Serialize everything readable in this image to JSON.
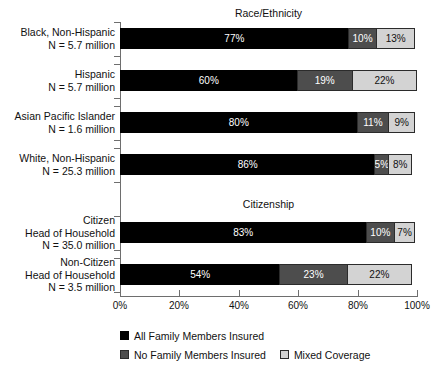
{
  "chart_data": {
    "type": "bar",
    "orientation": "horizontal",
    "stacked": true,
    "title": "",
    "xlabel": "",
    "ylabel": "",
    "xlim": [
      0,
      100
    ],
    "xticks": [
      "0%",
      "20%",
      "40%",
      "60%",
      "80%",
      "100%"
    ],
    "xtick_values": [
      0,
      20,
      40,
      60,
      80,
      100
    ],
    "grid": false,
    "legend_position": "bottom-left",
    "series": [
      {
        "name": "All Family Members Insured",
        "color": "#000000",
        "values": [
          77,
          60,
          80,
          86,
          83,
          54
        ]
      },
      {
        "name": "No Family Members Insured",
        "color": "#4d4d4d",
        "values": [
          10,
          19,
          11,
          5,
          10,
          23
        ]
      },
      {
        "name": "Mixed Coverage",
        "color": "#d3d3d3",
        "values": [
          13,
          22,
          9,
          8,
          7,
          22
        ]
      }
    ],
    "categories": [
      "Black, Non-Hispanic N = 5.7 million",
      "Hispanic N = 5.7 million",
      "Asian Pacific Islander N = 1.6  million",
      "White, Non-Hispanic N = 25.3 million",
      "Citizen Head of Household N = 35.0 million",
      "Non-Citizen Head of Household N = 3.5 million"
    ]
  },
  "sections": [
    {
      "id": "race",
      "title": "Race/Ethnicity"
    },
    {
      "id": "citizenship",
      "title": "Citizenship"
    }
  ],
  "rows": [
    {
      "label_lines": [
        "Black, Non-Hispanic",
        "N = 5.7 million"
      ],
      "segments": [
        {
          "key": "all",
          "value": 77,
          "label": "77%"
        },
        {
          "key": "none",
          "value": 10,
          "label": "10%"
        },
        {
          "key": "mixed",
          "value": 13,
          "label": "13%"
        }
      ]
    },
    {
      "label_lines": [
        "Hispanic",
        "N = 5.7 million"
      ],
      "segments": [
        {
          "key": "all",
          "value": 60,
          "label": "60%"
        },
        {
          "key": "none",
          "value": 19,
          "label": "19%"
        },
        {
          "key": "mixed",
          "value": 22,
          "label": "22%"
        }
      ]
    },
    {
      "label_lines": [
        "Asian Pacific Islander",
        "N = 1.6  million"
      ],
      "segments": [
        {
          "key": "all",
          "value": 80,
          "label": "80%"
        },
        {
          "key": "none",
          "value": 11,
          "label": "11%"
        },
        {
          "key": "mixed",
          "value": 9,
          "label": "9%"
        }
      ]
    },
    {
      "label_lines": [
        "White, Non-Hispanic",
        "N = 25.3 million"
      ],
      "segments": [
        {
          "key": "all",
          "value": 86,
          "label": "86%"
        },
        {
          "key": "none",
          "value": 5,
          "label": "5%"
        },
        {
          "key": "mixed",
          "value": 8,
          "label": "8%"
        }
      ]
    },
    {
      "label_lines": [
        "Citizen",
        "Head of Household",
        "N = 35.0 million"
      ],
      "segments": [
        {
          "key": "all",
          "value": 83,
          "label": "83%"
        },
        {
          "key": "none",
          "value": 10,
          "label": "10%"
        },
        {
          "key": "mixed",
          "value": 7,
          "label": "7%"
        }
      ]
    },
    {
      "label_lines": [
        "Non-Citizen",
        "Head of Household",
        "N = 3.5 million"
      ],
      "segments": [
        {
          "key": "all",
          "value": 54,
          "label": "54%"
        },
        {
          "key": "none",
          "value": 23,
          "label": "23%"
        },
        {
          "key": "mixed",
          "value": 22,
          "label": "22%"
        }
      ]
    }
  ],
  "legend": {
    "rows": [
      [
        {
          "key": "all",
          "label": "All Family Members Insured"
        }
      ],
      [
        {
          "key": "none",
          "label": "No Family Members Insured"
        },
        {
          "key": "mixed",
          "label": "Mixed Coverage"
        }
      ]
    ]
  },
  "colors": {
    "all": "#000000",
    "none": "#4d4d4d",
    "mixed": "#d3d3d3",
    "axis": "#6e6e6e",
    "text": "#111111"
  }
}
